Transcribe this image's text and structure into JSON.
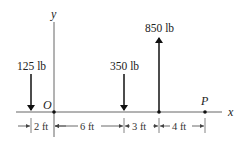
{
  "diagram": {
    "axes": {
      "x_label": "x",
      "y_label": "y",
      "origin_label": "O",
      "point_label": "P"
    },
    "forces": [
      {
        "label": "125 lb",
        "direction": "down",
        "x_ft": -2
      },
      {
        "label": "350 lb",
        "direction": "down",
        "x_ft": 6
      },
      {
        "label": "850 lb",
        "direction": "up",
        "x_ft": 9
      }
    ],
    "dimensions": [
      {
        "label": "2 ft"
      },
      {
        "label": "6 ft"
      },
      {
        "label": "3 ft"
      },
      {
        "label": "4 ft"
      }
    ]
  }
}
